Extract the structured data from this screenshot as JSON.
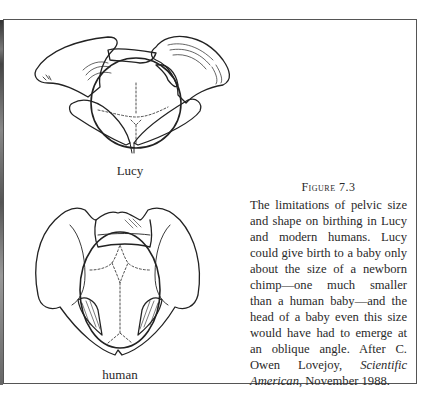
{
  "figure": {
    "number_label": "Figure 7.3",
    "caption_before_italic": "The limitations of pelvic size and shape on birthing in Lucy and modern humans. Lucy could give birth to a baby only about the size of a newborn chimp—one much smaller than a human baby—and the head of a baby even this size would have had to emerge at an oblique angle. After C. Owen Lovejoy, ",
    "caption_italic": "Scientific American",
    "caption_after_italic": ", November 1988."
  },
  "illustrations": [
    {
      "id": "lucy",
      "label": "Lucy",
      "description": "Lucy pelvis with chimp-sized baby head"
    },
    {
      "id": "human",
      "label": "human",
      "description": "Human pelvis with human baby head"
    }
  ],
  "colors": {
    "ink": "#2a2a2a",
    "frame": "#555555",
    "paper": "#ffffff"
  }
}
